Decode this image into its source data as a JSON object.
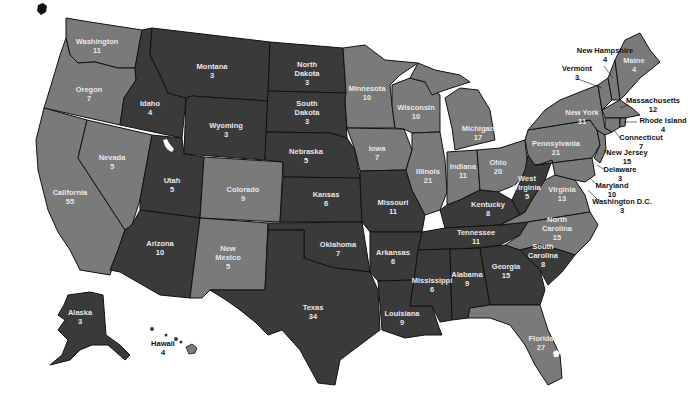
{
  "colors": {
    "light": "#7a7a7a",
    "dark": "#3a3a3a",
    "background": "#ffffff",
    "label_on_map": "#e8e8e8",
    "label_outside": "#111111"
  },
  "states": [
    {
      "name": "Washington",
      "value": "11",
      "shade": "light",
      "x": 97,
      "y": 46
    },
    {
      "name": "Oregon",
      "value": "7",
      "shade": "light",
      "x": 89,
      "y": 94
    },
    {
      "name": "California",
      "value": "55",
      "shade": "light",
      "x": 70,
      "y": 197
    },
    {
      "name": "Nevada",
      "value": "5",
      "shade": "light",
      "x": 112,
      "y": 162
    },
    {
      "name": "Idaho",
      "value": "4",
      "shade": "dark",
      "x": 150,
      "y": 108
    },
    {
      "name": "Montana",
      "value": "3",
      "shade": "dark",
      "x": 212,
      "y": 71
    },
    {
      "name": "Wyoming",
      "value": "3",
      "shade": "dark",
      "x": 226,
      "y": 130
    },
    {
      "name": "Utah",
      "value": "5",
      "shade": "dark",
      "x": 172,
      "y": 185
    },
    {
      "name": "Arizona",
      "value": "10",
      "shade": "dark",
      "x": 160,
      "y": 248
    },
    {
      "name": "Colorado",
      "value": "9",
      "shade": "light",
      "x": 243,
      "y": 194
    },
    {
      "name": "New Mexico",
      "value": "5",
      "shade": "light",
      "x": 228,
      "y": 257
    },
    {
      "name": "North Dakota",
      "value": "3",
      "shade": "dark",
      "x": 307,
      "y": 73
    },
    {
      "name": "South Dakota",
      "value": "3",
      "shade": "dark",
      "x": 307,
      "y": 112
    },
    {
      "name": "Nebraska",
      "value": "5",
      "shade": "dark",
      "x": 306,
      "y": 156
    },
    {
      "name": "Kansas",
      "value": "6",
      "shade": "dark",
      "x": 326,
      "y": 199
    },
    {
      "name": "Oklahoma",
      "value": "7",
      "shade": "dark",
      "x": 338,
      "y": 249
    },
    {
      "name": "Texas",
      "value": "34",
      "shade": "dark",
      "x": 313,
      "y": 312
    },
    {
      "name": "Minnesota",
      "value": "10",
      "shade": "light",
      "x": 367,
      "y": 93
    },
    {
      "name": "Iowa",
      "value": "7",
      "shade": "light",
      "x": 377,
      "y": 153
    },
    {
      "name": "Missouri",
      "value": "11",
      "shade": "dark",
      "x": 393,
      "y": 207
    },
    {
      "name": "Arkansas",
      "value": "6",
      "shade": "dark",
      "x": 393,
      "y": 257
    },
    {
      "name": "Louisiana",
      "value": "9",
      "shade": "dark",
      "x": 402,
      "y": 318
    },
    {
      "name": "Wisconsin",
      "value": "10",
      "shade": "light",
      "x": 416,
      "y": 112
    },
    {
      "name": "Illinois",
      "value": "21",
      "shade": "light",
      "x": 428,
      "y": 176
    },
    {
      "name": "Michigan",
      "value": "17",
      "shade": "light",
      "x": 478,
      "y": 133
    },
    {
      "name": "Indiana",
      "value": "11",
      "shade": "light",
      "x": 463,
      "y": 171
    },
    {
      "name": "Ohio",
      "value": "20",
      "shade": "light",
      "x": 498,
      "y": 167
    },
    {
      "name": "Kentucky",
      "value": "8",
      "shade": "dark",
      "x": 488,
      "y": 209
    },
    {
      "name": "Tennessee",
      "value": "11",
      "shade": "dark",
      "x": 476,
      "y": 237
    },
    {
      "name": "Mississippi",
      "value": "6",
      "shade": "dark",
      "x": 432,
      "y": 285
    },
    {
      "name": "Alabama",
      "value": "9",
      "shade": "dark",
      "x": 467,
      "y": 279
    },
    {
      "name": "Georgia",
      "value": "15",
      "shade": "dark",
      "x": 506,
      "y": 271
    },
    {
      "name": "West Virginia",
      "value": "5",
      "shade": "dark",
      "x": 527,
      "y": 187
    },
    {
      "name": "Virginia",
      "value": "13",
      "shade": "light",
      "x": 562,
      "y": 194
    },
    {
      "name": "North Carolina",
      "value": "15",
      "shade": "light",
      "x": 557,
      "y": 228
    },
    {
      "name": "South Carolina",
      "value": "8",
      "shade": "dark",
      "x": 543,
      "y": 255
    },
    {
      "name": "Florida",
      "value": "27",
      "shade": "light",
      "x": 541,
      "y": 343
    },
    {
      "name": "Pennsylvania",
      "value": "21",
      "shade": "light",
      "x": 556,
      "y": 148
    },
    {
      "name": "New York",
      "value": "31",
      "shade": "light",
      "x": 582,
      "y": 117
    },
    {
      "name": "Maine",
      "value": "4",
      "shade": "light",
      "x": 634,
      "y": 65
    },
    {
      "name": "Alaska",
      "value": "3",
      "shade": "dark",
      "x": 80,
      "y": 317
    }
  ],
  "callouts": [
    {
      "name": "New Hampshire",
      "value": "4",
      "x": 605,
      "y": 55
    },
    {
      "name": "Vermont",
      "value": "3",
      "x": 577,
      "y": 73
    },
    {
      "name": "Massachusetts",
      "value": "12",
      "x": 653,
      "y": 105
    },
    {
      "name": "Rhode Island",
      "value": "4",
      "x": 663,
      "y": 125
    },
    {
      "name": "Connecticut",
      "value": "7",
      "x": 641,
      "y": 142
    },
    {
      "name": "New Jersey",
      "value": "15",
      "x": 627,
      "y": 157
    },
    {
      "name": "Delaware",
      "value": "3",
      "x": 620,
      "y": 174
    },
    {
      "name": "Maryland",
      "value": "10",
      "x": 612,
      "y": 190
    },
    {
      "name": "Washington D.C.",
      "value": "3",
      "x": 622,
      "y": 206
    },
    {
      "name": "Hawaii",
      "value": "4",
      "x": 163,
      "y": 348
    }
  ]
}
